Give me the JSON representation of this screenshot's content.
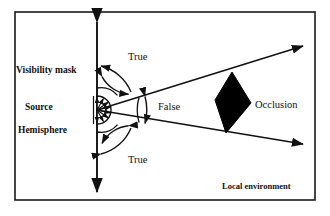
{
  "diagram": {
    "frame_caption": "Local environment",
    "labels": {
      "visibility_mask": "Visibility mask",
      "source": "Source",
      "hemisphere": "Hemisphere",
      "true_top": "True",
      "true_bottom": "True",
      "false": "False",
      "occlusion": "Occlusion",
      "local_environment": "Local environment"
    },
    "colors": {
      "ink": "#111111",
      "background": "#ffffff",
      "occluder_fill": "#000000",
      "frame": "#1a1a1a"
    },
    "geometry": {
      "frame": {
        "x": 15,
        "y": 12,
        "width": 300,
        "height": 188
      },
      "vertical_axis": {
        "x": 97,
        "y_top": 18,
        "y_bottom": 196,
        "double_headed": true
      },
      "source_point": {
        "x": 97,
        "y": 110
      },
      "hemisphere_radius": 14,
      "visibility_mask_arcs": [
        22,
        34
      ],
      "cone": {
        "apex": {
          "x": 97,
          "y": 110
        },
        "upper_tip": {
          "x": 307,
          "y": 45
        },
        "lower_tip": {
          "x": 307,
          "y": 145
        }
      },
      "false_arc": {
        "cx": 97,
        "cy": 110,
        "radius": 52
      },
      "occluder_vertices": [
        {
          "x": 232,
          "y": 72
        },
        {
          "x": 251,
          "y": 103
        },
        {
          "x": 226,
          "y": 133
        },
        {
          "x": 215,
          "y": 100
        }
      ]
    }
  }
}
